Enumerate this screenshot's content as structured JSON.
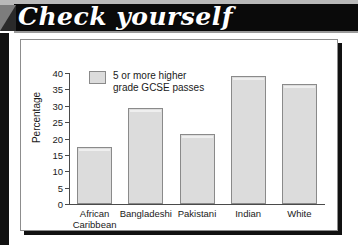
{
  "header": {
    "title": "Check yourself"
  },
  "chart_data": {
    "type": "bar",
    "title": "",
    "xlabel": "",
    "ylabel": "Percentage",
    "ylim": [
      0,
      40
    ],
    "yticks": [
      0,
      5,
      10,
      15,
      20,
      25,
      30,
      35,
      40
    ],
    "ytick_labels": [
      "0",
      "5",
      "10",
      "15",
      "20",
      "25",
      "30",
      "35",
      "40"
    ],
    "grid": false,
    "legend_position": "top-left-inside",
    "legend": [
      "5 or more higher\ngrade GCSE passes"
    ],
    "categories": [
      "African\nCaribbean",
      "Bangladeshi",
      "Pakistani",
      "Indian",
      "White"
    ],
    "values": [
      17.5,
      29.3,
      21.5,
      39.0,
      36.5
    ],
    "series": [
      {
        "name": "5 or more higher grade GCSE passes",
        "values": [
          17.5,
          29.3,
          21.5,
          39.0,
          36.5
        ]
      }
    ],
    "bar_color": "#dcdcdc",
    "bar_edge_color": "#8a8a8a"
  },
  "colors": {
    "banner_background": "#0a0a0a",
    "banner_text": "#ffffff",
    "page_background": "#ffffff",
    "frame_border": "#8d8d8d",
    "axis": "#4a4a4a"
  }
}
